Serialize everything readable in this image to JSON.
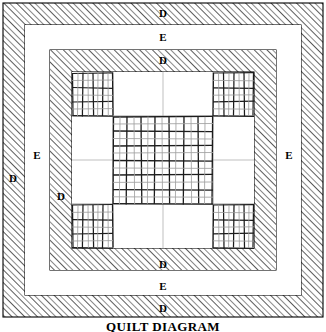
{
  "figure": {
    "caption": "QUILT DIAGRAM",
    "caption_top": 320,
    "width": 326,
    "height": 332,
    "background": "#ffffff",
    "ink_color": "#000000",
    "hatch_color": "#3a3a3a",
    "faint_line_color": "#b4b4b4"
  },
  "borders": [
    {
      "name": "outer-hatched-border",
      "label": "D",
      "style": "hatched",
      "x": 3,
      "y": 3,
      "width": 320,
      "height": 314,
      "thickness": 22
    },
    {
      "name": "outer-plain-border",
      "label": "E",
      "style": "plain",
      "x": 25,
      "y": 25,
      "width": 276,
      "height": 270,
      "thickness": 25
    },
    {
      "name": "inner-hatched-border",
      "label": "D",
      "style": "hatched",
      "x": 50,
      "y": 50,
      "width": 226,
      "height": 220,
      "thickness": 22
    }
  ],
  "labels": [
    {
      "id": "d-top-outer",
      "text": "D",
      "x": 163,
      "y": 13
    },
    {
      "id": "e-top",
      "text": "E",
      "x": 163,
      "y": 37
    },
    {
      "id": "d-top-inner",
      "text": "D",
      "x": 163,
      "y": 60
    },
    {
      "id": "d-left-outer",
      "text": "D",
      "x": 13,
      "y": 178
    },
    {
      "id": "e-left",
      "text": "E",
      "x": 37,
      "y": 155
    },
    {
      "id": "d-left-inner",
      "text": "D",
      "x": 61,
      "y": 196
    },
    {
      "id": "e-right",
      "text": "E",
      "x": 289,
      "y": 155
    },
    {
      "id": "d-bottom-inner",
      "text": "D",
      "x": 163,
      "y": 264
    },
    {
      "id": "e-bottom",
      "text": "E",
      "x": 163,
      "y": 286
    },
    {
      "id": "d-bottom-outer",
      "text": "D",
      "x": 163,
      "y": 308
    }
  ],
  "center_panel": {
    "name": "nine-patch-panel",
    "x": 72,
    "y": 72,
    "width": 182,
    "height": 176,
    "columns": 3,
    "rows": 3,
    "cells": [
      {
        "row": 0,
        "col": 0,
        "type": "patchwork",
        "grid_cols": 4,
        "grid_rows": 3
      },
      {
        "row": 0,
        "col": 1,
        "type": "plain"
      },
      {
        "row": 0,
        "col": 2,
        "type": "patchwork",
        "grid_cols": 4,
        "grid_rows": 3
      },
      {
        "row": 1,
        "col": 0,
        "type": "plain"
      },
      {
        "row": 1,
        "col": 1,
        "type": "patchwork",
        "grid_cols": 7,
        "grid_rows": 6
      },
      {
        "row": 1,
        "col": 2,
        "type": "plain"
      },
      {
        "row": 2,
        "col": 0,
        "type": "patchwork",
        "grid_cols": 4,
        "grid_rows": 3
      },
      {
        "row": 2,
        "col": 1,
        "type": "plain"
      },
      {
        "row": 2,
        "col": 2,
        "type": "patchwork",
        "grid_cols": 4,
        "grid_rows": 3
      }
    ],
    "column_edges": [
      72,
      113,
      213,
      254
    ],
    "row_edges": [
      72,
      116,
      204,
      248
    ]
  }
}
